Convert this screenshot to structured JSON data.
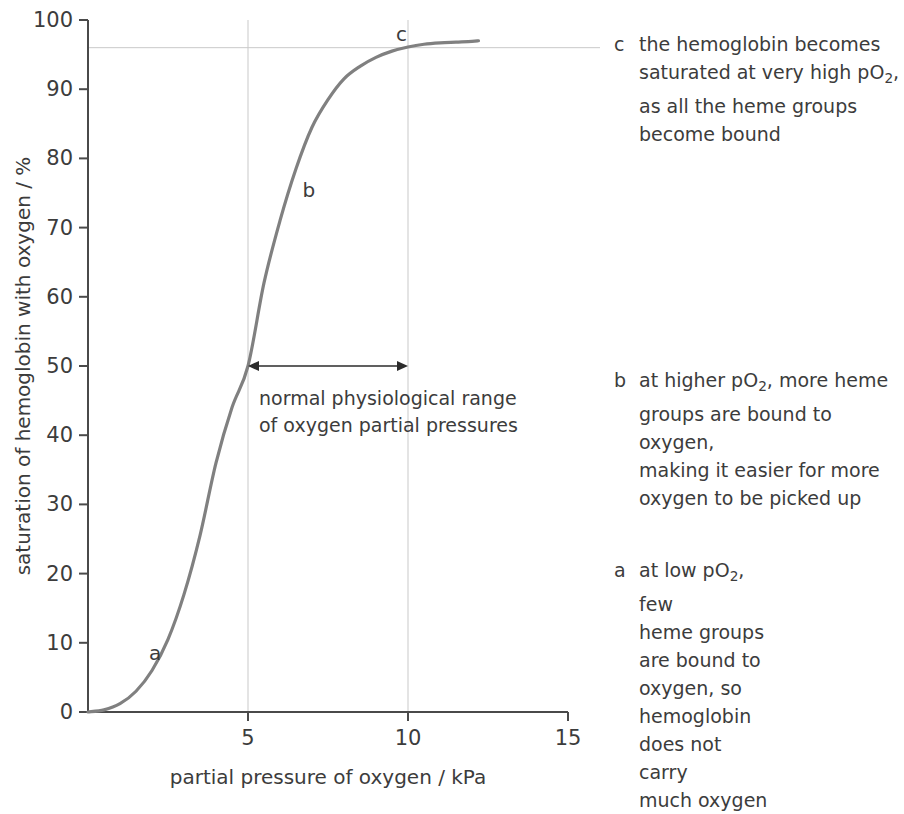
{
  "chart_data": {
    "type": "line",
    "title": "",
    "subtitle": "",
    "xlabel": "partial pressure of oxygen / kPa",
    "ylabel": "saturation of hemoglobin with oxygen / %",
    "xlim": [
      0,
      15
    ],
    "ylim": [
      0,
      100
    ],
    "xticks": [
      "0",
      "5",
      "10",
      "15"
    ],
    "xtick_values": [
      0,
      5,
      10,
      15
    ],
    "yticks": [
      "0",
      "10",
      "20",
      "30",
      "40",
      "50",
      "60",
      "70",
      "80",
      "90",
      "100"
    ],
    "ytick_values": [
      0,
      10,
      20,
      30,
      40,
      50,
      60,
      70,
      80,
      90,
      100
    ],
    "grid": "vertical gridlines at x=5 and x=10; horizontal reference line at y=96",
    "legend": "none",
    "series": [
      {
        "name": "oxygen dissociation curve",
        "color": "#808080",
        "x": [
          0.0,
          0.5,
          1.0,
          1.5,
          2.0,
          2.5,
          3.0,
          3.5,
          4.0,
          4.5,
          5.0,
          5.5,
          6.0,
          6.5,
          7.0,
          7.5,
          8.0,
          8.5,
          9.0,
          9.5,
          10.0,
          10.5,
          11.0,
          11.5,
          12.0,
          12.2
        ],
        "y": [
          0.0,
          0.3,
          1.2,
          3.0,
          6.0,
          10.5,
          17.0,
          25.5,
          36.0,
          44.0,
          50.0,
          62.0,
          71.0,
          78.5,
          84.5,
          88.5,
          91.5,
          93.3,
          94.6,
          95.5,
          96.1,
          96.5,
          96.7,
          96.8,
          96.9,
          97.0
        ]
      }
    ],
    "reference_lines": [
      {
        "name": "saturation-plateau-line",
        "orientation": "horizontal",
        "value": 96,
        "color": "#c9c9c9"
      },
      {
        "name": "physiological-range-lower",
        "orientation": "vertical",
        "value": 5,
        "color": "#c9c9c9"
      },
      {
        "name": "physiological-range-upper",
        "orientation": "vertical",
        "value": 10,
        "color": "#c9c9c9"
      }
    ],
    "annotations": [
      {
        "key": "a",
        "x": 2.1,
        "y": 8.5,
        "label": "a"
      },
      {
        "key": "b",
        "x": 6.9,
        "y": 75.5,
        "label": "b"
      },
      {
        "key": "c",
        "x": 9.8,
        "y": 98.0,
        "label": "c"
      }
    ],
    "range_marker": {
      "from": 5,
      "to": 10,
      "at_y": 50,
      "caption_line1": "normal physiological range",
      "caption_line2": "of oxygen partial pressures"
    }
  },
  "axes": {
    "y_title": "saturation of hemoglobin with oxygen / %",
    "x_title": "partial pressure of oxygen / kPa",
    "y_tick_labels": [
      "100",
      "90",
      "80",
      "70",
      "60",
      "50",
      "40",
      "30",
      "20",
      "10",
      "0"
    ],
    "x_tick_labels": [
      "0",
      "5",
      "10",
      "15"
    ]
  },
  "range_caption": {
    "line1": "normal physiological range",
    "line2": "of oxygen partial pressures"
  },
  "curve_markers": {
    "a": "a",
    "b": "b",
    "c": "c"
  },
  "notes": [
    {
      "key": "c",
      "lines": [
        "the hemoglobin becomes",
        "saturated at very high pO2,",
        "as all the heme groups",
        "become bound"
      ],
      "text_plain": "the hemoglobin becomes saturated at very high pO2, as all the heme groups become bound"
    },
    {
      "key": "b",
      "lines": [
        "at higher pO2, more heme",
        "groups are bound to oxygen,",
        "making it easier for more",
        "oxygen to be picked up"
      ],
      "text_plain": "at higher pO2, more heme groups are bound to oxygen, making it easier for more oxygen to be picked up"
    },
    {
      "key": "a",
      "lines": [
        "at low pO2, few",
        "heme groups",
        "are bound to",
        "oxygen, so",
        "hemoglobin",
        "does not carry",
        "much oxygen"
      ],
      "text_plain": "at low pO2, few heme groups are bound to oxygen, so hemoglobin does not carry much oxygen"
    }
  ],
  "colors": {
    "curve": "#808080",
    "axis": "#4a4a4a",
    "grid": "#c9c9c9",
    "text": "#3c3c3c",
    "arrow": "#2b2b2b",
    "background": "#ffffff"
  }
}
